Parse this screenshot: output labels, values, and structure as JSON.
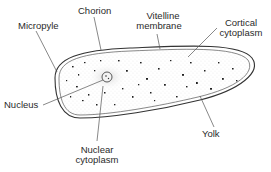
{
  "diagram": {
    "labels": {
      "chorion": "Chorion",
      "micropyle": "Micropyle",
      "vitelline_1": "Vitelline",
      "vitelline_2": "membrane",
      "cortical_1": "Cortical",
      "cortical_2": "cytoplasm",
      "nucleus": "Nucleus",
      "nuclear_1": "Nuclear",
      "nuclear_2": "cytoplasm",
      "yolk": "Yolk"
    },
    "colors": {
      "line": "#555555",
      "outline": "#333333",
      "stipple": "#9a9a9a",
      "yolk_dots": "#222222",
      "text": "#2a2a2a"
    }
  }
}
